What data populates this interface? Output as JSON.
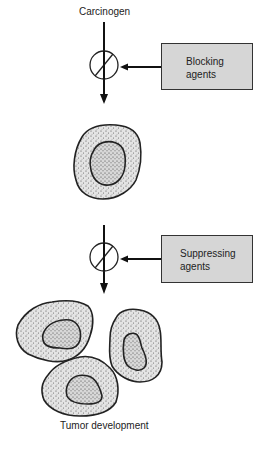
{
  "diagram": {
    "title_top": "Carcinogen",
    "title_bottom": "Tumor development",
    "blocking_box": {
      "line1": "Blocking",
      "line2": "agents"
    },
    "suppressing_box": {
      "line1": "Suppressing",
      "line2": "agents"
    },
    "colors": {
      "box_fill": "#d6d6d6",
      "stroke": "#222222",
      "cell_fill": "#dcdcdc"
    }
  }
}
